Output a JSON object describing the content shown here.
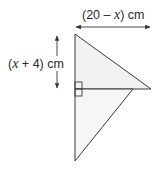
{
  "diagram": {
    "type": "geometry-figure",
    "labels": {
      "width": {
        "prefix": "(20 – ",
        "variable": "x",
        "suffix": ") cm"
      },
      "height": {
        "prefix": "(",
        "variable": "x",
        "suffix": " + 4) cm"
      }
    },
    "shapes": [
      {
        "name": "upper-triangle",
        "fill": "#f1f1f1"
      },
      {
        "name": "lower-triangle",
        "fill": "#f6f6f6"
      }
    ],
    "markers": [
      "right-angle"
    ],
    "colors": {
      "stroke": "#3a3a3a",
      "text": "#2a2a2a"
    }
  }
}
